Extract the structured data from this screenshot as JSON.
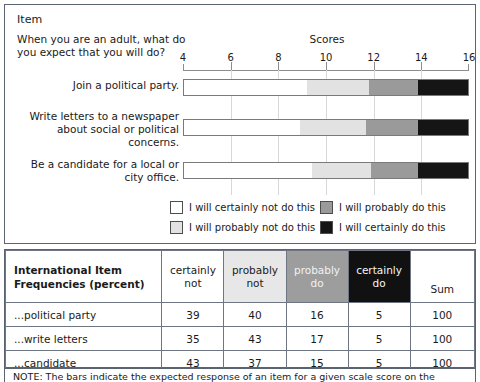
{
  "chart_panel": {
    "item_title": "Item",
    "question": "When you are an adult, what do you expect that you will do?",
    "scores_title": "Scores"
  },
  "chart_data": {
    "type": "bar",
    "orientation": "horizontal",
    "stacked": true,
    "title": "Scores",
    "xlabel": "",
    "ylabel": "",
    "xlim": [
      4,
      16
    ],
    "ticks": [
      4,
      6,
      8,
      10,
      12,
      14,
      16
    ],
    "grid": true,
    "legend_position": "bottom",
    "categories": [
      "Join a political party.",
      "Write letters to a newspaper about social or political concerns.",
      "Be a candidate for a local or city office."
    ],
    "series": [
      {
        "name": "I will certainly not do this",
        "color": "#ffffff",
        "boundaries": [
          9.2,
          8.9,
          9.4
        ]
      },
      {
        "name": "I will probably not do this",
        "color": "#e2e2e2",
        "boundaries": [
          11.8,
          11.7,
          11.9
        ]
      },
      {
        "name": "I will probably do this",
        "color": "#9a9a9a",
        "boundaries": [
          13.9,
          13.9,
          13.9
        ]
      },
      {
        "name": "I will certainly do this",
        "color": "#151515",
        "boundaries": [
          16,
          16,
          16
        ]
      }
    ]
  },
  "legend": [
    {
      "label": "I will certainly not do this",
      "swatch": "sw-cn"
    },
    {
      "label": "I will probably do this",
      "swatch": "sw-pd"
    },
    {
      "label": "I will probably not do this",
      "swatch": "sw-pn"
    },
    {
      "label": "I will certainly do this",
      "swatch": "sw-cd"
    }
  ],
  "table": {
    "corner_label": "International Item Frequencies (percent)",
    "headers": [
      {
        "line1": "certainly",
        "line2": "not"
      },
      {
        "line1": "probably",
        "line2": "not"
      },
      {
        "line1": "probably",
        "line2": "do"
      },
      {
        "line1": "certainly",
        "line2": "do"
      }
    ],
    "sum_header": "Sum",
    "rows": [
      {
        "label": "...political party",
        "certainly_not": "39",
        "probably_not": "40",
        "probably_do": "16",
        "certainly_do": "5",
        "sum": "100"
      },
      {
        "label": "...write letters",
        "certainly_not": "35",
        "probably_not": "43",
        "probably_do": "17",
        "certainly_do": "5",
        "sum": "100"
      },
      {
        "label": "...candidate",
        "certainly_not": "43",
        "probably_not": "37",
        "probably_do": "15",
        "certainly_do": "5",
        "sum": "100"
      }
    ]
  },
  "note": {
    "text": "NOTE: The bars indicate the expected response of an item for a given scale score on the"
  },
  "colors": {
    "certainly_not": "#ffffff",
    "probably_not": "#e2e2e2",
    "probably_do": "#9a9a9a",
    "certainly_do": "#151515",
    "border": "#5a6370",
    "grid": "#d8d8d8"
  }
}
